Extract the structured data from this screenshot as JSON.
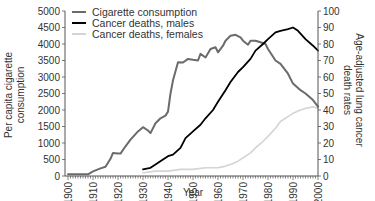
{
  "chart_data": {
    "type": "line",
    "title": "",
    "xlabel": "Year",
    "ylabel": "Per capita cigarette consumption",
    "ylabel_right": "Age-adjusted lung cancer death rates",
    "xlim": [
      1900,
      2000
    ],
    "ylim": [
      0,
      5000
    ],
    "ylim_right": [
      0,
      100
    ],
    "x_ticks": [
      "1900",
      "1910",
      "1920",
      "1930",
      "1940",
      "1950",
      "1960",
      "1970",
      "1980",
      "1990",
      "2000"
    ],
    "y_ticks": [
      "0",
      "500",
      "1000",
      "1500",
      "2000",
      "2500",
      "3000",
      "3500",
      "4000",
      "4500",
      "5000"
    ],
    "y_ticks_right": [
      "0",
      "10",
      "20",
      "30",
      "40",
      "50",
      "60",
      "70",
      "80",
      "90",
      "100"
    ],
    "grid": false,
    "legend_position": "upper-left",
    "series": [
      {
        "name": "Cigarette consumption",
        "axis": "left",
        "color": "#6b6b6b",
        "x": [
          1900,
          1902,
          1905,
          1908,
          1910,
          1913,
          1915,
          1917,
          1918,
          1920,
          1921,
          1923,
          1925,
          1928,
          1930,
          1932,
          1933,
          1935,
          1937,
          1939,
          1940,
          1941,
          1942,
          1944,
          1946,
          1948,
          1950,
          1952,
          1953,
          1955,
          1957,
          1959,
          1960,
          1962,
          1963,
          1965,
          1967,
          1969,
          1970,
          1972,
          1973,
          1975,
          1977,
          1979,
          1980,
          1983,
          1985,
          1988,
          1990,
          1993,
          1995,
          1998,
          2000
        ],
        "values": [
          50,
          50,
          50,
          50,
          140,
          230,
          280,
          520,
          700,
          680,
          680,
          900,
          1100,
          1350,
          1480,
          1380,
          1300,
          1600,
          1750,
          1830,
          1950,
          2500,
          2900,
          3450,
          3440,
          3550,
          3520,
          3500,
          3700,
          3590,
          3850,
          3900,
          3750,
          3950,
          4100,
          4250,
          4280,
          4200,
          4100,
          3980,
          4100,
          4100,
          4050,
          4000,
          3850,
          3500,
          3400,
          3100,
          2800,
          2600,
          2500,
          2300,
          2100
        ]
      },
      {
        "name": "Cancer deaths, males",
        "axis": "right",
        "color": "#000000",
        "x": [
          1930,
          1933,
          1935,
          1938,
          1940,
          1942,
          1945,
          1947,
          1950,
          1953,
          1955,
          1958,
          1960,
          1963,
          1965,
          1968,
          1970,
          1973,
          1975,
          1978,
          1980,
          1983,
          1985,
          1988,
          1990,
          1992,
          1995,
          1998,
          2000
        ],
        "values": [
          4,
          5,
          7,
          10,
          12,
          13,
          17,
          23,
          27,
          31,
          35,
          40,
          45,
          52,
          57,
          63,
          66,
          71,
          76,
          80,
          83,
          87,
          88,
          89,
          90,
          88,
          83,
          79,
          76
        ]
      },
      {
        "name": "Cancer deaths, females",
        "axis": "right",
        "color": "#d4d4d4",
        "x": [
          1930,
          1935,
          1940,
          1945,
          1950,
          1955,
          1960,
          1963,
          1965,
          1968,
          1970,
          1973,
          1975,
          1978,
          1980,
          1983,
          1985,
          1988,
          1990,
          1993,
          1995,
          1998,
          2000
        ],
        "values": [
          2,
          3,
          3,
          4,
          4,
          5,
          5,
          6,
          7,
          9,
          11,
          14,
          17,
          21,
          24,
          29,
          33,
          36,
          38,
          40,
          41,
          42,
          41
        ]
      }
    ]
  }
}
